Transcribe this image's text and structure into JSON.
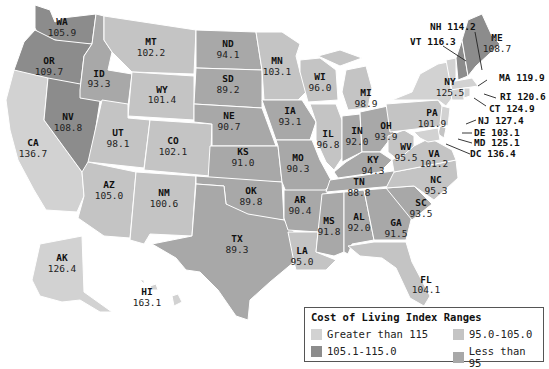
{
  "map": {
    "title": "Cost of Living Index by State",
    "colors": {
      "greater_than_115": "#d2d2d2",
      "range_105_1_115": "#8c8c8c",
      "range_95_105": "#c4c4c4",
      "less_than_95": "#a8a8a8",
      "border": "#ffffff",
      "background": "#ffffff"
    },
    "states": [
      {
        "code": "WA",
        "value": "105.9",
        "category": "105.1-115.0"
      },
      {
        "code": "OR",
        "value": "109.7",
        "category": "105.1-115.0"
      },
      {
        "code": "CA",
        "value": "136.7",
        "category": "Greater than 115"
      },
      {
        "code": "NV",
        "value": "108.8",
        "category": "105.1-115.0"
      },
      {
        "code": "ID",
        "value": "93.3",
        "category": "Less than 95"
      },
      {
        "code": "MT",
        "value": "102.2",
        "category": "95.0-105.0"
      },
      {
        "code": "WY",
        "value": "101.4",
        "category": "95.0-105.0"
      },
      {
        "code": "UT",
        "value": "98.1",
        "category": "95.0-105.0"
      },
      {
        "code": "AZ",
        "value": "105.0",
        "category": "95.0-105.0"
      },
      {
        "code": "CO",
        "value": "102.1",
        "category": "95.0-105.0"
      },
      {
        "code": "NM",
        "value": "100.6",
        "category": "95.0-105.0"
      },
      {
        "code": "ND",
        "value": "94.1",
        "category": "Less than 95"
      },
      {
        "code": "SD",
        "value": "89.2",
        "category": "Less than 95"
      },
      {
        "code": "NE",
        "value": "90.7",
        "category": "Less than 95"
      },
      {
        "code": "KS",
        "value": "91.0",
        "category": "Less than 95"
      },
      {
        "code": "OK",
        "value": "89.8",
        "category": "Less than 95"
      },
      {
        "code": "TX",
        "value": "89.3",
        "category": "Less than 95"
      },
      {
        "code": "MN",
        "value": "103.1",
        "category": "95.0-105.0"
      },
      {
        "code": "IA",
        "value": "93.1",
        "category": "Less than 95"
      },
      {
        "code": "MO",
        "value": "90.3",
        "category": "Less than 95"
      },
      {
        "code": "AR",
        "value": "90.4",
        "category": "Less than 95"
      },
      {
        "code": "LA",
        "value": "95.0",
        "category": "95.0-105.0"
      },
      {
        "code": "WI",
        "value": "96.0",
        "category": "95.0-105.0"
      },
      {
        "code": "IL",
        "value": "96.8",
        "category": "95.0-105.0"
      },
      {
        "code": "MI",
        "value": "98.9",
        "category": "95.0-105.0"
      },
      {
        "code": "IN",
        "value": "92.0",
        "category": "Less than 95"
      },
      {
        "code": "OH",
        "value": "93.9",
        "category": "Less than 95"
      },
      {
        "code": "KY",
        "value": "94.3",
        "category": "Less than 95"
      },
      {
        "code": "TN",
        "value": "88.8",
        "category": "Less than 95"
      },
      {
        "code": "MS",
        "value": "91.8",
        "category": "Less than 95"
      },
      {
        "code": "AL",
        "value": "92.0",
        "category": "Less than 95"
      },
      {
        "code": "GA",
        "value": "91.5",
        "category": "Less than 95"
      },
      {
        "code": "FL",
        "value": "104.1",
        "category": "95.0-105.0"
      },
      {
        "code": "SC",
        "value": "93.5",
        "category": "Less than 95"
      },
      {
        "code": "NC",
        "value": "95.3",
        "category": "95.0-105.0"
      },
      {
        "code": "VA",
        "value": "101.2",
        "category": "95.0-105.0"
      },
      {
        "code": "WV",
        "value": "95.5",
        "category": "95.0-105.0"
      },
      {
        "code": "PA",
        "value": "101.9",
        "category": "95.0-105.0"
      },
      {
        "code": "NY",
        "value": "125.5",
        "category": "Greater than 115"
      },
      {
        "code": "VT",
        "value": "116.3",
        "category": "Greater than 115"
      },
      {
        "code": "NH",
        "value": "114.2",
        "category": "105.1-115.0"
      },
      {
        "code": "ME",
        "value": "108.7",
        "category": "105.1-115.0"
      },
      {
        "code": "MA",
        "value": "119.9",
        "category": "Greater than 115"
      },
      {
        "code": "RI",
        "value": "120.6",
        "category": "Greater than 115"
      },
      {
        "code": "CT",
        "value": "124.9",
        "category": "Greater than 115"
      },
      {
        "code": "NJ",
        "value": "127.4",
        "category": "Greater than 115"
      },
      {
        "code": "DE",
        "value": "103.1",
        "category": "95.0-105.0"
      },
      {
        "code": "MD",
        "value": "125.1",
        "category": "Greater than 115"
      },
      {
        "code": "DC",
        "value": "136.4",
        "category": "Greater than 115"
      },
      {
        "code": "AK",
        "value": "126.4",
        "category": "Greater than 115"
      },
      {
        "code": "HI",
        "value": "163.1",
        "category": "Greater than 115"
      }
    ]
  },
  "labels": {
    "WA": {
      "code": "WA",
      "value": "105.9"
    },
    "OR": {
      "code": "OR",
      "value": "109.7"
    },
    "CA": {
      "code": "CA",
      "value": "136.7"
    },
    "NV": {
      "code": "NV",
      "value": "108.8"
    },
    "ID": {
      "code": "ID",
      "value": "93.3"
    },
    "MT": {
      "code": "MT",
      "value": "102.2"
    },
    "WY": {
      "code": "WY",
      "value": "101.4"
    },
    "UT": {
      "code": "UT",
      "value": "98.1"
    },
    "AZ": {
      "code": "AZ",
      "value": "105.0"
    },
    "CO": {
      "code": "CO",
      "value": "102.1"
    },
    "NM": {
      "code": "NM",
      "value": "100.6"
    },
    "ND": {
      "code": "ND",
      "value": "94.1"
    },
    "SD": {
      "code": "SD",
      "value": "89.2"
    },
    "NE": {
      "code": "NE",
      "value": "90.7"
    },
    "KS": {
      "code": "KS",
      "value": "91.0"
    },
    "OK": {
      "code": "OK",
      "value": "89.8"
    },
    "TX": {
      "code": "TX",
      "value": "89.3"
    },
    "MN": {
      "code": "MN",
      "value": "103.1"
    },
    "IA": {
      "code": "IA",
      "value": "93.1"
    },
    "MO": {
      "code": "MO",
      "value": "90.3"
    },
    "AR": {
      "code": "AR",
      "value": "90.4"
    },
    "LA": {
      "code": "LA",
      "value": "95.0"
    },
    "WI": {
      "code": "WI",
      "value": "96.0"
    },
    "IL": {
      "code": "IL",
      "value": "96.8"
    },
    "MI": {
      "code": "MI",
      "value": "98.9"
    },
    "IN": {
      "code": "IN",
      "value": "92.0"
    },
    "OH": {
      "code": "OH",
      "value": "93.9"
    },
    "KY": {
      "code": "KY",
      "value": "94.3"
    },
    "TN": {
      "code": "TN",
      "value": "88.8"
    },
    "MS": {
      "code": "MS",
      "value": "91.8"
    },
    "AL": {
      "code": "AL",
      "value": "92.0"
    },
    "GA": {
      "code": "GA",
      "value": "91.5"
    },
    "FL": {
      "code": "FL",
      "value": "104.1"
    },
    "SC": {
      "code": "SC",
      "value": "93.5"
    },
    "NC": {
      "code": "NC",
      "value": "95.3"
    },
    "VA": {
      "code": "VA",
      "value": "101.2"
    },
    "WV": {
      "code": "WV",
      "value": "95.5"
    },
    "PA": {
      "code": "PA",
      "value": "101.9"
    },
    "NY": {
      "code": "NY",
      "value": "125.5"
    },
    "ME": {
      "code": "ME",
      "value": "108.7"
    },
    "AK": {
      "code": "AK",
      "value": "126.4"
    },
    "HI": {
      "code": "HI",
      "value": "163.1"
    },
    "NH": "NH 114.2",
    "VT": "VT 116.3",
    "MA": "MA 119.9",
    "RI": "RI 120.6",
    "CT": "CT 124.9",
    "NJ": "NJ 127.4",
    "DE": "DE 103.1",
    "MD": "MD 125.1",
    "DC": "DC 136.4"
  },
  "legend": {
    "title": "Cost of Living Index Ranges",
    "items": [
      {
        "label": "Greater than 115",
        "color": "#d2d2d2"
      },
      {
        "label": "95.0-105.0",
        "color": "#c4c4c4"
      },
      {
        "label": "105.1-115.0",
        "color": "#8c8c8c"
      },
      {
        "label": "Less than 95",
        "color": "#a8a8a8"
      }
    ]
  }
}
